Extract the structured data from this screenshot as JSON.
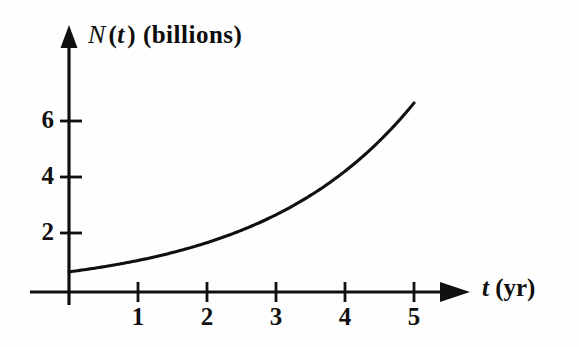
{
  "figure": {
    "background_color": "#fefefe",
    "ink_color": "#101010"
  },
  "axes": {
    "y_axis_label": {
      "function_name": "N",
      "variable": "t",
      "units": "(billions)",
      "full_text": "N(t) (billions)"
    },
    "x_axis_label": {
      "variable": "t",
      "units": "(yr)",
      "full_text": "t (yr)"
    }
  },
  "chart_data": {
    "type": "line",
    "title": "",
    "xlabel": "t (yr)",
    "ylabel": "N(t) (billions)",
    "xlim": [
      0,
      5.8
    ],
    "ylim": [
      0,
      8
    ],
    "grid": false,
    "legend": null,
    "x_ticks": [
      1,
      2,
      3,
      4,
      5
    ],
    "x_tick_labels": [
      "1",
      "2",
      "3",
      "4",
      "5"
    ],
    "y_ticks": [
      2,
      4,
      6
    ],
    "y_tick_labels": [
      "2",
      "4",
      "6"
    ],
    "series": [
      {
        "name": "N(t)",
        "description": "exponential growth curve",
        "x": [
          0,
          0.5,
          1,
          1.5,
          2,
          2.5,
          3,
          3.5,
          4,
          4.5,
          5
        ],
        "y": [
          0.72,
          0.9,
          1.13,
          1.41,
          1.77,
          2.21,
          2.76,
          3.45,
          4.32,
          5.4,
          6.75
        ]
      }
    ],
    "axis_arrows": {
      "x_arrow": true,
      "y_arrow": true
    }
  },
  "tick_labels": {
    "x": [
      "1",
      "2",
      "3",
      "4",
      "5"
    ],
    "y": [
      "6",
      "4",
      "2"
    ]
  }
}
